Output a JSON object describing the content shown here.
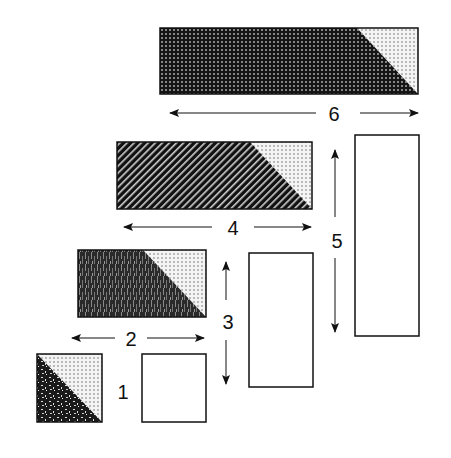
{
  "diagram": {
    "colors": {
      "stroke": "#111111",
      "fill_dark": "#1a1a1a",
      "fill_light": "#f2f2f2",
      "background": "#ffffff"
    },
    "labels": {
      "l1": "1",
      "l2": "2",
      "l3": "3",
      "l4": "4",
      "l5": "5",
      "l6": "6"
    },
    "shapes": [
      {
        "id": "square-1",
        "pattern": "speckle",
        "split": "diagonal"
      },
      {
        "id": "square-1-empty",
        "pattern": "none"
      },
      {
        "id": "rect-2",
        "pattern": "wood-grain",
        "split": "diagonal"
      },
      {
        "id": "rect-3-empty",
        "pattern": "none"
      },
      {
        "id": "rect-4",
        "pattern": "diagonal-stripes",
        "split": "diagonal"
      },
      {
        "id": "rect-5-empty",
        "pattern": "none"
      },
      {
        "id": "rect-6",
        "pattern": "dot-grid",
        "split": "diagonal"
      }
    ]
  }
}
